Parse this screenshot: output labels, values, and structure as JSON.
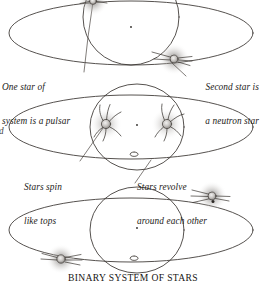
{
  "figure": {
    "title": "BINARY SYSTEM OF STARS",
    "background_color": "#ffffff",
    "ink_color": "#2b2724",
    "glow_color": "#a9a5a2"
  },
  "labels": {
    "pulsar": {
      "line1": "One star of",
      "line2": "system is a pulsar"
    },
    "neutron_star": {
      "line1": "Second star is",
      "line2": "a neutron star"
    },
    "spin": {
      "line1": "Stars spin",
      "line2": "like tops"
    },
    "revolve": {
      "line1": "Stars revolve",
      "line2": "around each other"
    },
    "clipped_left_glyph": "d"
  },
  "panels": [
    {
      "name": "top-panel",
      "description": "Wide horizontal orbit ellipse crossed by a tall vertical ellipse, pulsar star at top, neutron star at right",
      "orbit_center_marker": true,
      "stars": [
        {
          "name": "pulsar-star",
          "type": "pulsar",
          "beams": "straight-rays"
        },
        {
          "name": "neutron-star",
          "type": "neutron",
          "beams": "straight-rays"
        }
      ]
    },
    {
      "name": "middle-panel",
      "description": "Wide horizontal orbit ellipse with vertical ellipse, two spinning stars with curved spin arcs",
      "orbit_center_marker": true,
      "stars": [
        {
          "name": "spinning-star-left",
          "type": "spinning",
          "beams": "curved-arcs"
        },
        {
          "name": "spinning-star-right",
          "type": "spinning",
          "beams": "curved-arcs"
        }
      ]
    },
    {
      "name": "bottom-panel",
      "description": "Wide horizontal orbit ellipse with vertical ellipse, stars at upper-right and lower-left of the orbit",
      "orbit_center_marker": true,
      "stars": [
        {
          "name": "orbiting-star-upper-right",
          "type": "pulsar",
          "beams": "straight-rays"
        },
        {
          "name": "orbiting-star-lower-left",
          "type": "neutron",
          "beams": "straight-rays"
        }
      ]
    }
  ]
}
